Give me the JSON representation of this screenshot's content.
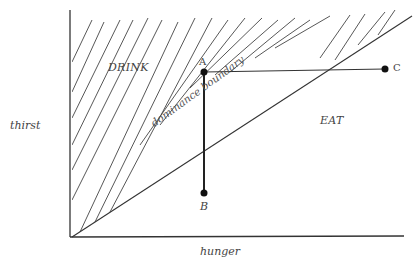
{
  "diagram": {
    "axes": {
      "x_label": "hunger",
      "y_label": "thirst"
    },
    "regions": {
      "upper": "DRINK",
      "lower": "EAT"
    },
    "boundary_label": "dominance boundary",
    "points": [
      {
        "id": "A",
        "label": "A"
      },
      {
        "id": "B",
        "label": "B"
      },
      {
        "id": "C",
        "label": "C"
      }
    ],
    "colors": {
      "ink": "#333333",
      "background": "#ffffff"
    }
  }
}
